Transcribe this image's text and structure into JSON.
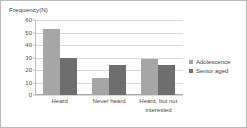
{
  "chart_data": {
    "type": "bar",
    "title": "",
    "xlabel": "",
    "ylabel": "Frequency(N)",
    "ylim": [
      0,
      60
    ],
    "yticks": [
      0,
      10,
      20,
      30,
      40,
      50,
      60
    ],
    "grid": true,
    "legend_position": "right",
    "categories": [
      "Heard",
      "Never heard",
      "Heard, but not interested"
    ],
    "series": [
      {
        "name": "Adolescence",
        "color": "#a6a6a6",
        "values": [
          53,
          14,
          29
        ]
      },
      {
        "name": "Senior aged",
        "color": "#6e6e6e",
        "values": [
          30,
          24,
          24
        ]
      }
    ]
  }
}
